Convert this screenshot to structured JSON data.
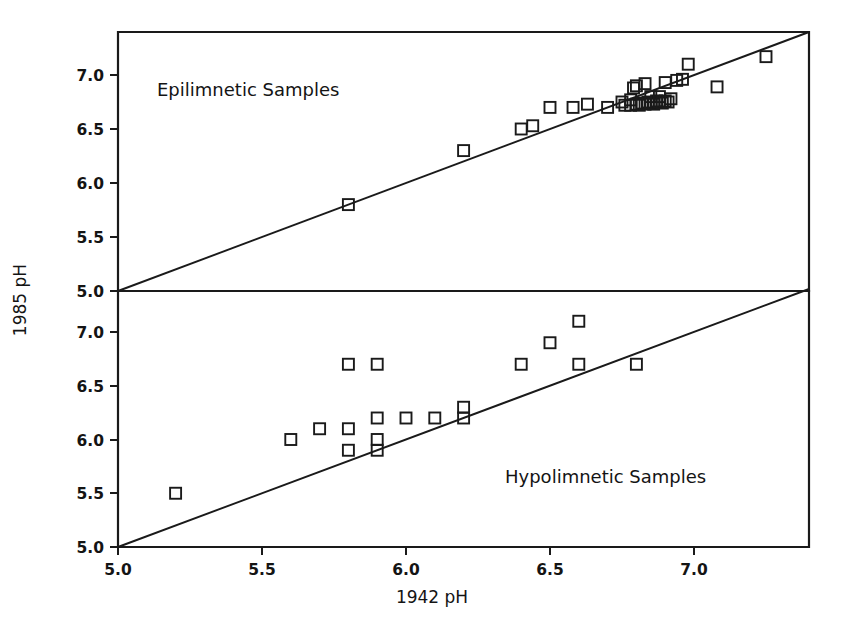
{
  "figure": {
    "xlabel": "1942 pH",
    "ylabel": "1985 pH",
    "x_ticks": [
      "5.0",
      "5.5",
      "6.0",
      "6.5",
      "7.0"
    ],
    "y_ticks_top": [
      "5.0",
      "5.5",
      "6.0",
      "6.5",
      "7.0"
    ],
    "y_ticks_bottom": [
      "5.0",
      "5.5",
      "6.0",
      "6.5",
      "7.0"
    ],
    "panel_top_label": "Epilimnetic Samples",
    "panel_bottom_label": "Hypolimnetic Samples",
    "line_color": "#1a1a1a",
    "marker_color": "#1a1a1a",
    "background": "#ffffff"
  },
  "chart_data": [
    {
      "type": "scatter",
      "title": "Epilimnetic Samples",
      "xlabel": "1942 pH",
      "ylabel": "1985 pH",
      "xlim": [
        5.0,
        7.4
      ],
      "ylim": [
        5.0,
        7.4
      ],
      "x_ticks": [
        5.0,
        5.5,
        6.0,
        6.5,
        7.0
      ],
      "y_ticks": [
        5.0,
        5.5,
        6.0,
        6.5,
        7.0
      ],
      "grid": false,
      "legend": "none",
      "annotations": [
        "Epilimnetic Samples"
      ],
      "reference_line": {
        "type": "1:1",
        "from": [
          5.0,
          5.0
        ],
        "to": [
          7.4,
          7.4
        ]
      },
      "marker": "open-square",
      "points": [
        [
          5.8,
          5.8
        ],
        [
          6.2,
          6.3
        ],
        [
          6.4,
          6.5
        ],
        [
          6.44,
          6.53
        ],
        [
          6.5,
          6.7
        ],
        [
          6.58,
          6.7
        ],
        [
          6.63,
          6.73
        ],
        [
          6.7,
          6.7
        ],
        [
          6.75,
          6.75
        ],
        [
          6.76,
          6.72
        ],
        [
          6.78,
          6.77
        ],
        [
          6.78,
          6.72
        ],
        [
          6.79,
          6.88
        ],
        [
          6.8,
          6.73
        ],
        [
          6.8,
          6.9
        ],
        [
          6.81,
          6.72
        ],
        [
          6.82,
          6.74
        ],
        [
          6.83,
          6.73
        ],
        [
          6.83,
          6.92
        ],
        [
          6.84,
          6.75
        ],
        [
          6.85,
          6.74
        ],
        [
          6.85,
          6.8
        ],
        [
          6.86,
          6.73
        ],
        [
          6.87,
          6.76
        ],
        [
          6.88,
          6.75
        ],
        [
          6.88,
          6.8
        ],
        [
          6.89,
          6.74
        ],
        [
          6.9,
          6.76
        ],
        [
          6.9,
          6.93
        ],
        [
          6.91,
          6.75
        ],
        [
          6.92,
          6.78
        ],
        [
          6.94,
          6.95
        ],
        [
          6.96,
          6.96
        ],
        [
          6.98,
          7.1
        ],
        [
          7.08,
          6.89
        ],
        [
          7.25,
          7.17
        ]
      ]
    },
    {
      "type": "scatter",
      "title": "Hypolimnetic Samples",
      "xlabel": "1942 pH",
      "ylabel": "1985 pH",
      "xlim": [
        5.0,
        7.4
      ],
      "ylim": [
        5.0,
        7.4
      ],
      "x_ticks": [
        5.0,
        5.5,
        6.0,
        6.5,
        7.0
      ],
      "y_ticks": [
        5.0,
        5.5,
        6.0,
        6.5,
        7.0
      ],
      "grid": false,
      "legend": "none",
      "annotations": [
        "Hypolimnetic Samples"
      ],
      "reference_line": {
        "type": "1:1",
        "from": [
          5.0,
          5.0
        ],
        "to": [
          7.4,
          7.4
        ]
      },
      "marker": "open-square",
      "points": [
        [
          5.2,
          5.5
        ],
        [
          5.6,
          6.0
        ],
        [
          5.7,
          6.1
        ],
        [
          5.8,
          6.1
        ],
        [
          5.8,
          5.9
        ],
        [
          5.8,
          6.7
        ],
        [
          5.9,
          6.7
        ],
        [
          5.9,
          6.2
        ],
        [
          5.9,
          6.0
        ],
        [
          5.9,
          5.9
        ],
        [
          6.0,
          6.2
        ],
        [
          6.1,
          6.2
        ],
        [
          6.2,
          6.3
        ],
        [
          6.2,
          6.2
        ],
        [
          6.4,
          6.7
        ],
        [
          6.5,
          6.9
        ],
        [
          6.6,
          7.1
        ],
        [
          6.6,
          6.7
        ],
        [
          6.8,
          6.7
        ]
      ]
    }
  ]
}
